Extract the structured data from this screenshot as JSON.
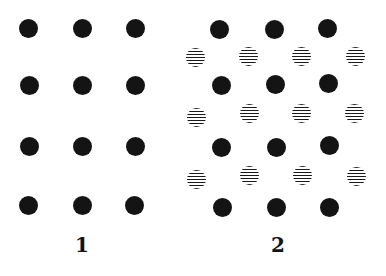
{
  "figure": {
    "panels": [
      {
        "label": "1",
        "label_pos": [
          82,
          245
        ],
        "dots": [
          {
            "x": 28,
            "y": 28,
            "type": "solid"
          },
          {
            "x": 82,
            "y": 28,
            "type": "solid"
          },
          {
            "x": 135,
            "y": 28,
            "type": "solid"
          },
          {
            "x": 29,
            "y": 85,
            "type": "solid"
          },
          {
            "x": 82,
            "y": 85,
            "type": "solid"
          },
          {
            "x": 135,
            "y": 85,
            "type": "solid"
          },
          {
            "x": 29,
            "y": 146,
            "type": "solid"
          },
          {
            "x": 82,
            "y": 146,
            "type": "solid"
          },
          {
            "x": 135,
            "y": 146,
            "type": "solid"
          },
          {
            "x": 28,
            "y": 205,
            "type": "solid"
          },
          {
            "x": 82,
            "y": 205,
            "type": "solid"
          },
          {
            "x": 134,
            "y": 205,
            "type": "solid"
          }
        ]
      },
      {
        "label": "2",
        "label_pos": [
          278,
          245
        ],
        "dots": [
          {
            "x": 219,
            "y": 29,
            "type": "solid"
          },
          {
            "x": 274,
            "y": 29,
            "type": "solid"
          },
          {
            "x": 327,
            "y": 28,
            "type": "solid"
          },
          {
            "x": 195,
            "y": 57,
            "type": "striped"
          },
          {
            "x": 248,
            "y": 56,
            "type": "striped"
          },
          {
            "x": 301,
            "y": 56,
            "type": "striped"
          },
          {
            "x": 355,
            "y": 56,
            "type": "striped"
          },
          {
            "x": 221,
            "y": 85,
            "type": "solid"
          },
          {
            "x": 275,
            "y": 84,
            "type": "solid"
          },
          {
            "x": 328,
            "y": 83,
            "type": "solid"
          },
          {
            "x": 196,
            "y": 117,
            "type": "striped"
          },
          {
            "x": 249,
            "y": 113,
            "type": "striped"
          },
          {
            "x": 301,
            "y": 113,
            "type": "striped"
          },
          {
            "x": 354,
            "y": 113,
            "type": "striped"
          },
          {
            "x": 221,
            "y": 147,
            "type": "solid"
          },
          {
            "x": 276,
            "y": 147,
            "type": "solid"
          },
          {
            "x": 329,
            "y": 145,
            "type": "solid"
          },
          {
            "x": 196,
            "y": 179,
            "type": "striped"
          },
          {
            "x": 249,
            "y": 175,
            "type": "striped"
          },
          {
            "x": 302,
            "y": 175,
            "type": "striped"
          },
          {
            "x": 356,
            "y": 176,
            "type": "striped"
          },
          {
            "x": 222,
            "y": 207,
            "type": "solid"
          },
          {
            "x": 276,
            "y": 207,
            "type": "solid"
          },
          {
            "x": 329,
            "y": 207,
            "type": "solid"
          }
        ]
      }
    ],
    "dot_size": 19,
    "colors": {
      "ink": "#141414",
      "background": "#ffffff"
    }
  }
}
